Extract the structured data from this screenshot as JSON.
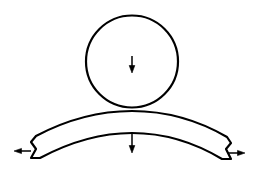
{
  "canvas": {
    "width": 258,
    "height": 170,
    "background_color": "#ffffff",
    "stroke_color": "#000000",
    "fill_color": "#ffffff"
  },
  "diagram": {
    "type": "line-drawing",
    "shapes": {
      "roller_circle": {
        "name": "circle",
        "center_x": 132,
        "center_y": 61.5,
        "radius": 46,
        "stroke_width": 2.2,
        "fill": "#ffffff"
      },
      "curved_beam": {
        "name": "crescent-beam",
        "left_end_x": 31,
        "right_end_x": 231,
        "top_arc_center_y": 112,
        "bottom_arc_center_y": 133,
        "left_end_top_y": 142,
        "left_end_bottom_y": 158,
        "right_end_top_y": 143,
        "right_end_bottom_y": 159,
        "stroke_width": 2.2,
        "fill": "#ffffff"
      }
    },
    "arrows": [
      {
        "name": "load-arrow-circle",
        "label": "downward load on circle",
        "direction": "down",
        "x": 132,
        "y_start": 56,
        "y_end": 72,
        "head_width": 5,
        "head_length": 6,
        "stroke_width": 1.5
      },
      {
        "name": "load-arrow-beam",
        "label": "downward load below beam",
        "direction": "down",
        "x": 132,
        "y_start": 134,
        "y_end": 152,
        "head_width": 5,
        "head_length": 6,
        "stroke_width": 1.5
      },
      {
        "name": "reaction-arrow-left",
        "label": "leftward reaction at left support",
        "direction": "left",
        "y": 151,
        "x_start": 31,
        "x_end": 15,
        "head_width": 5,
        "head_length": 6,
        "stroke_width": 1.5
      },
      {
        "name": "reaction-arrow-right",
        "label": "rightward reaction at right support",
        "direction": "right",
        "y": 153,
        "x_start": 228,
        "x_end": 244,
        "head_width": 5,
        "head_length": 6,
        "stroke_width": 1.5
      }
    ]
  }
}
